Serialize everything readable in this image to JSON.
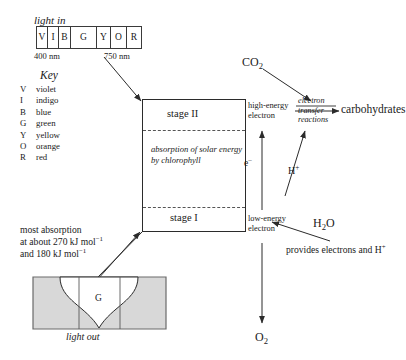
{
  "diagram": {
    "light_in": {
      "label": "light in",
      "spectrum_cells": [
        {
          "abbr": "V",
          "width": 11
        },
        {
          "abbr": "I",
          "width": 11
        },
        {
          "abbr": "B",
          "width": 12
        },
        {
          "abbr": "G",
          "width": 26
        },
        {
          "abbr": "Y",
          "width": 14
        },
        {
          "abbr": "O",
          "width": 16
        },
        {
          "abbr": "R",
          "width": 14
        }
      ],
      "wavelength_min": "400 nm",
      "wavelength_max": "750 nm"
    },
    "key": {
      "title": "Key",
      "entries": [
        {
          "abbr": "V",
          "name": "violet"
        },
        {
          "abbr": "I",
          "name": "indigo"
        },
        {
          "abbr": "B",
          "name": "blue"
        },
        {
          "abbr": "G",
          "name": "green"
        },
        {
          "abbr": "Y",
          "name": "yellow"
        },
        {
          "abbr": "O",
          "name": "orange"
        },
        {
          "abbr": "R",
          "name": "red"
        }
      ]
    },
    "main_box": {
      "stage_two": "stage II",
      "stage_one": "stage I",
      "absorption_text": "absorption of solar energy by chlorophyll"
    },
    "labels": {
      "high_energy_electron": "high-energy electron",
      "low_energy_electron": "low-energy electron",
      "electron_symbol": "e–",
      "proton_symbol": "H+",
      "co2": "CO2",
      "h2o": "H2O",
      "o2": "O2",
      "carbohydrates": "carbohydrates",
      "electron_transfer_reactions": "electron transfer reactions",
      "provides_note": "provides electrons and H+"
    },
    "absorption_note": {
      "line1": "most absorption",
      "line2": "at about 270 kJ mol",
      "line2_sup": "−1",
      "line3": "and 180 kJ mol",
      "line3_sup": "−1"
    },
    "light_out": {
      "label": "light out",
      "band_letter": "G"
    },
    "colors": {
      "stroke": "#2b2b2b",
      "dashed": "#555555",
      "fill_gray": "#d8d8d8",
      "background": "#ffffff"
    }
  }
}
